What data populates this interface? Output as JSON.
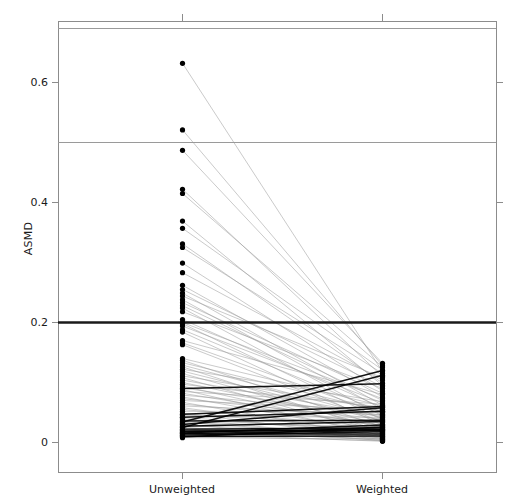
{
  "chart_data": {
    "type": "line",
    "title": "",
    "subtitle": "",
    "xlabel": "",
    "ylabel": "ASMD",
    "categories": [
      "Unweighted",
      "Weighted"
    ],
    "xtick_labels": [
      "Unweighted",
      "Weighted"
    ],
    "ytick_labels": [
      "0",
      "0.2",
      "0.4",
      "0.6"
    ],
    "ytick_values": [
      0,
      0.2,
      0.4,
      0.6
    ],
    "ylim": [
      -0.042,
      0.71
    ],
    "xlim": [
      0.5,
      2.5
    ],
    "grid": false,
    "legend": "none",
    "annotations": [
      {
        "name": "threshold-line-0.2",
        "y": 0.2,
        "style": "thick black horizontal reference line"
      },
      {
        "name": "reference-line-0.5",
        "y": 0.5,
        "style": "thin gray horizontal line"
      },
      {
        "name": "reference-line-0.69",
        "y": 0.69,
        "style": "thin gray horizontal line"
      }
    ],
    "series": [
      {
        "name": "covariate-1",
        "values": [
          0.632,
          0.118
        ]
      },
      {
        "name": "covariate-2",
        "values": [
          0.521,
          0.128
        ]
      },
      {
        "name": "covariate-3",
        "values": [
          0.487,
          0.132
        ]
      },
      {
        "name": "covariate-4",
        "values": [
          0.422,
          0.11
        ]
      },
      {
        "name": "covariate-5",
        "values": [
          0.415,
          0.126
        ]
      },
      {
        "name": "covariate-6",
        "values": [
          0.369,
          0.095
        ]
      },
      {
        "name": "covariate-7",
        "values": [
          0.357,
          0.121
        ]
      },
      {
        "name": "covariate-8",
        "values": [
          0.331,
          0.099
        ]
      },
      {
        "name": "covariate-9",
        "values": [
          0.325,
          0.115
        ]
      },
      {
        "name": "covariate-10",
        "values": [
          0.299,
          0.086
        ]
      },
      {
        "name": "covariate-11",
        "values": [
          0.283,
          0.104
        ]
      },
      {
        "name": "covariate-12",
        "values": [
          0.262,
          0.076
        ]
      },
      {
        "name": "covariate-13",
        "values": [
          0.255,
          0.093
        ]
      },
      {
        "name": "covariate-14",
        "values": [
          0.249,
          0.062
        ]
      },
      {
        "name": "covariate-15",
        "values": [
          0.244,
          0.108
        ]
      },
      {
        "name": "covariate-16",
        "values": [
          0.238,
          0.055
        ]
      },
      {
        "name": "covariate-17",
        "values": [
          0.233,
          0.082
        ]
      },
      {
        "name": "covariate-18",
        "values": [
          0.228,
          0.07
        ]
      },
      {
        "name": "covariate-19",
        "values": [
          0.224,
          0.044
        ]
      },
      {
        "name": "covariate-20",
        "values": [
          0.218,
          0.09
        ]
      },
      {
        "name": "covariate-21",
        "values": [
          0.205,
          0.058
        ]
      },
      {
        "name": "covariate-22",
        "values": [
          0.2,
          0.073
        ]
      },
      {
        "name": "covariate-23",
        "values": [
          0.198,
          0.038
        ]
      },
      {
        "name": "covariate-24",
        "values": [
          0.194,
          0.066
        ]
      },
      {
        "name": "covariate-25",
        "values": [
          0.188,
          0.05
        ]
      },
      {
        "name": "covariate-26",
        "values": [
          0.184,
          0.029
        ]
      },
      {
        "name": "covariate-27",
        "values": [
          0.17,
          0.08
        ]
      },
      {
        "name": "covariate-28",
        "values": [
          0.166,
          0.047
        ]
      },
      {
        "name": "covariate-29",
        "values": [
          0.163,
          0.034
        ]
      },
      {
        "name": "covariate-30",
        "values": [
          0.14,
          0.061
        ]
      },
      {
        "name": "covariate-31",
        "values": [
          0.137,
          0.026
        ]
      },
      {
        "name": "covariate-32",
        "values": [
          0.133,
          0.052
        ]
      },
      {
        "name": "covariate-33",
        "values": [
          0.129,
          0.041
        ]
      },
      {
        "name": "covariate-34",
        "values": [
          0.126,
          0.018
        ]
      },
      {
        "name": "covariate-35",
        "values": [
          0.122,
          0.068
        ]
      },
      {
        "name": "covariate-36",
        "values": [
          0.119,
          0.036
        ]
      },
      {
        "name": "covariate-37",
        "values": [
          0.115,
          0.023
        ]
      },
      {
        "name": "covariate-38",
        "values": [
          0.111,
          0.056
        ]
      },
      {
        "name": "covariate-39",
        "values": [
          0.108,
          0.014
        ]
      },
      {
        "name": "covariate-40",
        "values": [
          0.104,
          0.045
        ]
      },
      {
        "name": "covariate-41",
        "values": [
          0.1,
          0.031
        ]
      },
      {
        "name": "covariate-42",
        "values": [
          0.097,
          0.059
        ]
      },
      {
        "name": "covariate-43",
        "values": [
          0.094,
          0.02
        ]
      },
      {
        "name": "covariate-44",
        "values": [
          0.091,
          0.043
        ]
      },
      {
        "name": "covariate-45",
        "values": [
          0.088,
          0.011
        ]
      },
      {
        "name": "covariate-46",
        "values": [
          0.085,
          0.064
        ]
      },
      {
        "name": "covariate-47",
        "values": [
          0.082,
          0.028
        ]
      },
      {
        "name": "covariate-48",
        "values": [
          0.079,
          0.049
        ]
      },
      {
        "name": "covariate-49",
        "values": [
          0.076,
          0.016
        ]
      },
      {
        "name": "covariate-50",
        "values": [
          0.073,
          0.039
        ]
      },
      {
        "name": "covariate-51",
        "values": [
          0.07,
          0.054
        ]
      },
      {
        "name": "covariate-52",
        "values": [
          0.067,
          0.009
        ]
      },
      {
        "name": "covariate-53",
        "values": [
          0.064,
          0.033
        ]
      },
      {
        "name": "covariate-54",
        "values": [
          0.061,
          0.046
        ]
      },
      {
        "name": "covariate-55",
        "values": [
          0.058,
          0.013
        ]
      },
      {
        "name": "covariate-56",
        "values": [
          0.055,
          0.025
        ]
      },
      {
        "name": "covariate-57",
        "values": [
          0.052,
          0.051
        ]
      },
      {
        "name": "covariate-58",
        "values": [
          0.049,
          0.007
        ]
      },
      {
        "name": "covariate-59",
        "values": [
          0.046,
          0.03
        ]
      },
      {
        "name": "covariate-60",
        "values": [
          0.044,
          0.042
        ]
      },
      {
        "name": "covariate-61",
        "values": [
          0.042,
          0.017
        ]
      },
      {
        "name": "covariate-62",
        "values": [
          0.04,
          0.005
        ]
      },
      {
        "name": "covariate-63",
        "values": [
          0.038,
          0.022
        ]
      },
      {
        "name": "covariate-64",
        "values": [
          0.036,
          0.037
        ]
      },
      {
        "name": "covariate-65",
        "values": [
          0.034,
          0.01
        ]
      },
      {
        "name": "covariate-66",
        "values": [
          0.032,
          0.027
        ]
      },
      {
        "name": "covariate-67",
        "values": [
          0.03,
          0.003
        ]
      },
      {
        "name": "covariate-68",
        "values": [
          0.028,
          0.019
        ]
      },
      {
        "name": "covariate-69",
        "values": [
          0.027,
          0.035
        ]
      },
      {
        "name": "covariate-70",
        "values": [
          0.025,
          0.008
        ]
      },
      {
        "name": "covariate-71",
        "values": [
          0.024,
          0.015
        ]
      },
      {
        "name": "covariate-72",
        "values": [
          0.022,
          0.024
        ]
      },
      {
        "name": "covariate-73",
        "values": [
          0.021,
          0.004
        ]
      },
      {
        "name": "covariate-74",
        "values": [
          0.02,
          0.012
        ]
      },
      {
        "name": "covariate-75",
        "values": [
          0.018,
          0.021
        ]
      },
      {
        "name": "covariate-76",
        "values": [
          0.017,
          0.006
        ]
      },
      {
        "name": "covariate-77",
        "values": [
          0.016,
          0.029
        ]
      },
      {
        "name": "covariate-78",
        "values": [
          0.015,
          0.002
        ]
      },
      {
        "name": "covariate-79",
        "values": [
          0.014,
          0.014
        ]
      },
      {
        "name": "covariate-80",
        "values": [
          0.013,
          0.009
        ]
      },
      {
        "name": "covariate-81",
        "values": [
          0.012,
          0.018
        ]
      },
      {
        "name": "covariate-82",
        "values": [
          0.011,
          0.003
        ]
      },
      {
        "name": "covariate-83",
        "values": [
          0.01,
          0.011
        ]
      },
      {
        "name": "covariate-84",
        "values": [
          0.009,
          0.026
        ]
      },
      {
        "name": "covariate-85",
        "values": [
          0.008,
          0.006
        ]
      },
      {
        "name": "covariate-86",
        "values": [
          0.034,
          0.12
        ]
      },
      {
        "name": "covariate-87",
        "values": [
          0.025,
          0.112
        ]
      },
      {
        "name": "covariate-88",
        "values": [
          0.09,
          0.098
        ]
      },
      {
        "name": "covariate-89",
        "values": [
          0.047,
          0.06
        ]
      },
      {
        "name": "covariate-90",
        "values": [
          0.03,
          0.058
        ]
      },
      {
        "name": "covariate-91",
        "values": [
          0.019,
          0.022
        ]
      },
      {
        "name": "covariate-92",
        "values": [
          0.042,
          0.052
        ]
      },
      {
        "name": "covariate-93",
        "values": [
          0.015,
          0.02
        ]
      }
    ]
  },
  "colors": {
    "axis": "#808080",
    "point": "#000000",
    "slope_line": "#9a9a9a",
    "threshold_line": "#1a1a1a",
    "reference_line": "#9a9a9a",
    "background": "#ffffff"
  }
}
